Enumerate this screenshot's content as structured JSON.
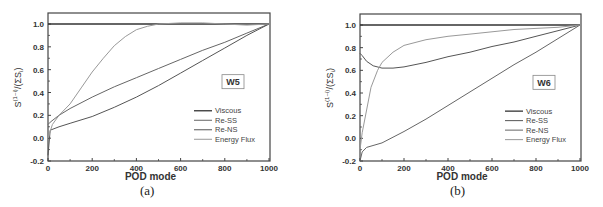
{
  "chart_data": [
    {
      "type": "line",
      "panel": "(a)",
      "annotation": "W5",
      "xlabel": "POD mode",
      "ylabel": "S_i^(1~i)/(ΣS_i)",
      "xlim": [
        0,
        1000
      ],
      "ylim": [
        -0.2,
        1.1
      ],
      "xticks": [
        "0",
        "200",
        "400",
        "600",
        "800",
        "1000"
      ],
      "yticks": [
        "-0.2",
        "0.0",
        "0.2",
        "0.4",
        "0.6",
        "0.8",
        "1.0"
      ],
      "legend_position": "lower right",
      "series": [
        {
          "name": "Viscous",
          "color": "#333333",
          "x": [
            0,
            1000
          ],
          "y": [
            1.0,
            1.0
          ]
        },
        {
          "name": "Re-SS",
          "color": "#666666",
          "x": [
            0,
            10,
            50,
            100,
            200,
            300,
            400,
            500,
            600,
            700,
            800,
            900,
            1000
          ],
          "y": [
            0.12,
            0.14,
            0.2,
            0.26,
            0.36,
            0.45,
            0.53,
            0.61,
            0.69,
            0.77,
            0.84,
            0.92,
            1.0
          ]
        },
        {
          "name": "Re-NS",
          "color": "#555555",
          "x": [
            0,
            10,
            50,
            100,
            200,
            300,
            400,
            500,
            600,
            700,
            800,
            900,
            1000
          ],
          "y": [
            -0.15,
            0.07,
            0.1,
            0.13,
            0.19,
            0.27,
            0.36,
            0.46,
            0.57,
            0.68,
            0.79,
            0.9,
            1.0
          ]
        },
        {
          "name": "Energy Flux",
          "color": "#999999",
          "x": [
            0,
            20,
            50,
            100,
            150,
            200,
            250,
            300,
            350,
            400,
            450,
            500,
            600,
            700,
            800,
            900,
            1000
          ],
          "y": [
            0.0,
            0.12,
            0.2,
            0.3,
            0.44,
            0.58,
            0.7,
            0.81,
            0.89,
            0.95,
            0.98,
            1.0,
            1.01,
            1.01,
            1.0,
            0.99,
            1.0
          ]
        }
      ]
    },
    {
      "type": "line",
      "panel": "(b)",
      "annotation": "W6",
      "xlabel": "POD mode",
      "ylabel": "S_i^(1~i)/(ΣS_i)",
      "xlim": [
        0,
        1000
      ],
      "ylim": [
        -0.2,
        1.1
      ],
      "xticks": [
        "0",
        "200",
        "400",
        "600",
        "800",
        "1000"
      ],
      "yticks": [
        "-0.2",
        "0.0",
        "0.2",
        "0.4",
        "0.6",
        "0.8",
        "1.0"
      ],
      "legend_position": "lower right",
      "series": [
        {
          "name": "Viscous",
          "color": "#333333",
          "x": [
            0,
            1000
          ],
          "y": [
            1.0,
            1.0
          ]
        },
        {
          "name": "Re-SS",
          "color": "#555555",
          "x": [
            0,
            10,
            30,
            60,
            100,
            150,
            200,
            300,
            400,
            500,
            600,
            700,
            800,
            900,
            1000
          ],
          "y": [
            0.75,
            0.73,
            0.68,
            0.64,
            0.62,
            0.62,
            0.63,
            0.67,
            0.72,
            0.76,
            0.81,
            0.85,
            0.9,
            0.95,
            1.0
          ]
        },
        {
          "name": "Re-NS",
          "color": "#666666",
          "x": [
            0,
            10,
            30,
            100,
            200,
            300,
            400,
            500,
            600,
            700,
            800,
            900,
            1000
          ],
          "y": [
            -0.2,
            -0.12,
            -0.08,
            -0.04,
            0.06,
            0.17,
            0.29,
            0.41,
            0.53,
            0.65,
            0.76,
            0.88,
            1.0
          ]
        },
        {
          "name": "Energy Flux",
          "color": "#999999",
          "x": [
            0,
            10,
            30,
            50,
            80,
            100,
            150,
            200,
            300,
            400,
            500,
            600,
            700,
            800,
            900,
            1000
          ],
          "y": [
            -0.1,
            0.05,
            0.25,
            0.45,
            0.6,
            0.67,
            0.76,
            0.82,
            0.87,
            0.9,
            0.92,
            0.94,
            0.96,
            0.97,
            0.98,
            1.0
          ]
        }
      ]
    }
  ],
  "panels": {
    "a": {
      "caption": "(a)",
      "box_label": "W5",
      "xlabel": "POD mode",
      "ylabel_main": "S",
      "ylabel_sup": "(1~i)",
      "ylabel_sub": "i",
      "ylabel_rest": "/(ΣS",
      "ylabel_rest_sub": "i",
      "ylabel_close": ")"
    },
    "b": {
      "caption": "(b)",
      "box_label": "W6",
      "xlabel": "POD mode",
      "ylabel_main": "S",
      "ylabel_sup": "(1~i)",
      "ylabel_sub": "i",
      "ylabel_rest": "/(ΣS",
      "ylabel_rest_sub": "i",
      "ylabel_close": ")"
    }
  },
  "legend": [
    "Viscous",
    "Re-SS",
    "Re-NS",
    "Energy Flux"
  ],
  "xticks": [
    "0",
    "200",
    "400",
    "600",
    "800",
    "1000"
  ],
  "yticks": [
    "-0.2",
    "0.0",
    "0.2",
    "0.4",
    "0.6",
    "0.8",
    "1.0"
  ]
}
